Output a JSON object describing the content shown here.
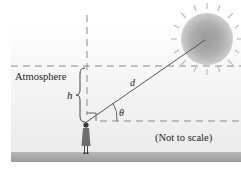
{
  "diagram": {
    "labels": {
      "atmosphere": "Atmosphere",
      "height": "h",
      "distance": "d",
      "angle": "θ",
      "note": "(Not to scale)"
    },
    "elements": {
      "sun": "sun-icon",
      "observer": "person-icon",
      "sight_line": "line from observer to sun",
      "vertical_reference": "dashed vertical line",
      "atmosphere_top": "dashed horizontal line",
      "horizon": "dashed horizontal line",
      "brace": "curly brace spanning h",
      "right_angle_marker": "right-angle square"
    },
    "colors": {
      "background_top": "#ffffff",
      "background_atmosphere": "#eeeeee",
      "ground": "#a8a8a8",
      "sun": "#9a9a9a",
      "lines": "#555555",
      "dashes": "#8a8a8a"
    }
  }
}
